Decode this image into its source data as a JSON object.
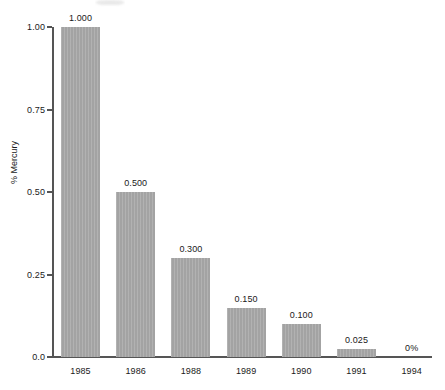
{
  "chart_data": {
    "type": "bar",
    "title": "",
    "xlabel": "",
    "ylabel": "% Mercury",
    "categories": [
      "1985",
      "1986",
      "1988",
      "1989",
      "1990",
      "1991",
      "1994"
    ],
    "values": [
      1.0,
      0.5,
      0.3,
      0.15,
      0.1,
      0.025,
      0
    ],
    "point_labels": [
      "1.000",
      "0.500",
      "0.300",
      "0.150",
      "0.100",
      "0.025",
      "0%"
    ],
    "ylim": [
      0.0,
      1.0
    ],
    "ytick_labels": [
      "1.00",
      "0.75",
      "0.50",
      "0.25",
      "0.0"
    ],
    "ytick_values": [
      1.0,
      0.75,
      0.5,
      0.25,
      0.0
    ],
    "grid": false,
    "legend": null,
    "bar_color": "#a3a3a3",
    "axis_color": "#555555",
    "text_color": "#1a1a1a"
  },
  "axis": {
    "y_title": "% Mercury"
  }
}
